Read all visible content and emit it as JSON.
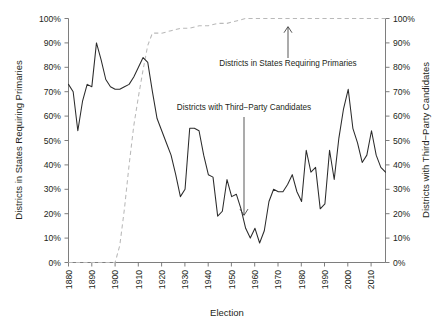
{
  "chart_data": {
    "type": "line",
    "title": "",
    "xlabel": "Election",
    "ylabel_left": "Districts in States Requiring Primaries",
    "ylabel_right": "Districts with Third−Party Candidates",
    "xlim": [
      1880,
      2016
    ],
    "ylim": [
      0,
      100
    ],
    "grid": false,
    "legend_position": "none",
    "xticks": [
      1880,
      1890,
      1900,
      1910,
      1920,
      1930,
      1940,
      1950,
      1960,
      1970,
      1980,
      1990,
      2000,
      2010
    ],
    "xtick_labels": [
      "1880",
      "1890",
      "1900",
      "1910",
      "1920",
      "1930",
      "1940",
      "1950",
      "1960",
      "1970",
      "1980",
      "1990",
      "2000",
      "2010"
    ],
    "yticks": [
      0,
      10,
      20,
      30,
      40,
      50,
      60,
      70,
      80,
      90,
      100
    ],
    "ytick_labels_left": [
      "0%",
      "10%",
      "20%",
      "30%",
      "40%",
      "50%",
      "60%",
      "70%",
      "80%",
      "90%",
      "100%"
    ],
    "ytick_labels_right": [
      "0%",
      "10%",
      "20%",
      "30%",
      "40%",
      "50%",
      "60%",
      "70%",
      "80%",
      "90%",
      "100%"
    ],
    "series": [
      {
        "name": "Districts with Third−Party Candidates",
        "axis": "right",
        "style": "solid",
        "color": "#2b2b2b",
        "x": [
          1880,
          1882,
          1884,
          1886,
          1888,
          1890,
          1892,
          1894,
          1896,
          1898,
          1900,
          1902,
          1904,
          1906,
          1908,
          1910,
          1912,
          1914,
          1916,
          1918,
          1920,
          1922,
          1924,
          1926,
          1928,
          1930,
          1932,
          1934,
          1936,
          1938,
          1940,
          1942,
          1944,
          1946,
          1948,
          1950,
          1952,
          1954,
          1956,
          1958,
          1960,
          1962,
          1964,
          1966,
          1968,
          1970,
          1972,
          1974,
          1976,
          1978,
          1980,
          1982,
          1984,
          1986,
          1988,
          1990,
          1992,
          1994,
          1996,
          1998,
          2000,
          2002,
          2004,
          2006,
          2008,
          2010,
          2012,
          2014,
          2016
        ],
        "y": [
          73,
          70,
          54,
          66,
          73,
          72,
          90,
          83,
          75,
          72,
          71,
          71,
          72,
          73,
          76,
          80,
          84,
          82,
          70,
          59,
          54,
          49,
          44,
          36,
          27,
          30,
          55,
          55,
          54,
          44,
          36,
          35,
          19,
          21,
          34,
          27,
          28,
          22,
          14,
          10,
          14,
          8,
          13,
          25,
          30,
          29,
          29,
          32,
          36,
          29,
          25,
          46,
          37,
          39,
          22,
          24,
          46,
          34,
          51,
          63,
          71,
          55,
          49,
          41,
          44,
          54,
          44,
          39,
          37
        ]
      },
      {
        "name": "Districts in States Requiring Primaries",
        "axis": "left",
        "style": "dashed",
        "color": "#b9b9b9",
        "x": [
          1880,
          1890,
          1898,
          1900,
          1902,
          1904,
          1906,
          1908,
          1910,
          1912,
          1914,
          1916,
          1920,
          1924,
          1928,
          1932,
          1936,
          1940,
          1944,
          1948,
          1952,
          1956,
          1960,
          1980,
          2000,
          2016
        ],
        "y": [
          0,
          0,
          0,
          0,
          7,
          22,
          40,
          56,
          68,
          79,
          89,
          94,
          94,
          95,
          96,
          96,
          97,
          97,
          98,
          98,
          99,
          100,
          100,
          100,
          100,
          100
        ]
      }
    ],
    "annotations": [
      {
        "text": "Districts in States Requiring Primaries",
        "target_series": "Districts in States Requiring Primaries",
        "arrow_direction": "up"
      },
      {
        "text": "Districts with Third−Party Candidates",
        "target_series": "Districts with Third−Party Candidates",
        "arrow_direction": "down"
      }
    ]
  }
}
